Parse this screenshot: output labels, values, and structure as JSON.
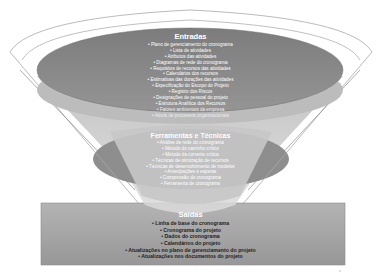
{
  "diagram": {
    "type": "funnel",
    "colors": {
      "background": "#ffffff",
      "inputs_ellipse": "#8c8c8c",
      "funnel_body": "#c8c8c8",
      "tools_ellipse": "#9a9a9a",
      "tools_inner": "#c4c4c4",
      "outputs_box": "#a6a6a6",
      "outline": "#9a9a9a"
    },
    "inputs": {
      "title": "Entradas",
      "items": [
        "• Plano de gerenciamento do cronograma",
        "• Lista de atividades",
        "• Atributos das atividades",
        "• Diagramas de rede do cronograma",
        "• Requisitos de recursos das atividades",
        "• Calendários dos recursos",
        "• Estimativas das durações das atividades",
        "• Especificação do Escopo do Projeto",
        "• Registro dos Riscos",
        "• Designações de pessoal do projeto",
        "• Estrutura Analítica dos Recursos",
        "• Fatores ambientais da empresa",
        "• Ativos de processos organizacionais"
      ]
    },
    "tools": {
      "title": "Ferramentas e Técnicas",
      "items": [
        "• Análise de rede do cronograma",
        "• Método do caminho crítico",
        "• Método da corrente crítica",
        "• Técnicas de otimização de recursos",
        "• Técnicas de desenvolvimento de modelos",
        "• Antecipações e esperas",
        "• Compressão do cronograma",
        "• Ferramenta de cronograma"
      ]
    },
    "outputs": {
      "title": "Saídas",
      "items": [
        "• Linha de base do cronograma",
        "• Cronograma do projeto",
        "• Dados do cronograma",
        "• Calendários do projeto",
        "• Atualizações no plano de gerenciamento do projeto",
        "• Atualizações nos documentos do projeto"
      ]
    }
  }
}
